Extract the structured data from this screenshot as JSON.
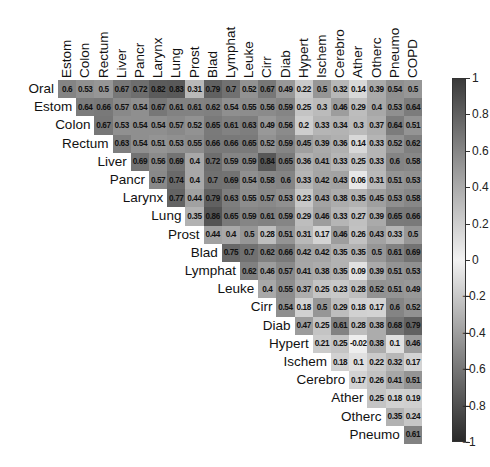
{
  "chart_data": {
    "type": "heatmap",
    "title": "",
    "subtitle": "",
    "variables": [
      "Oral",
      "Estom",
      "Colon",
      "Rectum",
      "Liver",
      "Pancr",
      "Larynx",
      "Lung",
      "Prost",
      "Blad",
      "Lymphat",
      "Leuke",
      "Cirr",
      "Diab",
      "Hypert",
      "Ischem",
      "Cerebro",
      "Ather",
      "Otherc",
      "Pneumo",
      "COPD"
    ],
    "row_labels": [
      "Oral",
      "Estom",
      "Colon",
      "Rectum",
      "Liver",
      "Pancr",
      "Larynx",
      "Lung",
      "Prost",
      "Blad",
      "Lymphat",
      "Leuke",
      "Cirr",
      "Diab",
      "Hypert",
      "Ischem",
      "Cerebro",
      "Ather",
      "Otherc",
      "Pneumo"
    ],
    "col_labels": [
      "Estom",
      "Colon",
      "Rectum",
      "Liver",
      "Pancr",
      "Larynx",
      "Lung",
      "Prost",
      "Blad",
      "Lymphat",
      "Leuke",
      "Cirr",
      "Diab",
      "Hypert",
      "Ischem",
      "Cerebro",
      "Ather",
      "Otherc",
      "Pneumo",
      "COPD"
    ],
    "layout": "upper-triangular; row i shows correlations with columns i..19",
    "values": [
      [
        "0.6",
        "0.53",
        "0.5",
        "0.67",
        "0.72",
        "0.82",
        "0.83",
        "0.31",
        "0.79",
        "0.7",
        "0.52",
        "0.67",
        "0.49",
        "0.22",
        "0.5",
        "0.32",
        "0.14",
        "0.39",
        "0.54",
        "0.5"
      ],
      [
        "0.64",
        "0.66",
        "0.57",
        "0.54",
        "0.67",
        "0.61",
        "0.61",
        "0.62",
        "0.54",
        "0.55",
        "0.56",
        "0.59",
        "0.25",
        "0.3",
        "0.46",
        "0.29",
        "0.4",
        "0.53",
        "0.64"
      ],
      [
        "0.67",
        "0.53",
        "0.54",
        "0.54",
        "0.57",
        "0.52",
        "0.65",
        "0.61",
        "0.63",
        "0.49",
        "0.56",
        "0.2",
        "0.33",
        "0.34",
        "0.3",
        "0.37",
        "0.64",
        "0.51"
      ],
      [
        "0.63",
        "0.54",
        "0.51",
        "0.53",
        "0.55",
        "0.66",
        "0.66",
        "0.65",
        "0.52",
        "0.59",
        "0.45",
        "0.39",
        "0.36",
        "0.14",
        "0.33",
        "0.52",
        "0.62"
      ],
      [
        "0.69",
        "0.56",
        "0.69",
        "0.4",
        "0.72",
        "0.59",
        "0.59",
        "0.84",
        "0.65",
        "0.36",
        "0.41",
        "0.33",
        "0.25",
        "0.33",
        "0.6",
        "0.58"
      ],
      [
        "0.57",
        "0.74",
        "0.4",
        "0.7",
        "0.69",
        "0.54",
        "0.58",
        "0.6",
        "0.33",
        "0.42",
        "0.43",
        "0.06",
        "0.31",
        "0.51",
        "0.53"
      ],
      [
        "0.77",
        "0.44",
        "0.79",
        "0.63",
        "0.55",
        "0.57",
        "0.53",
        "0.23",
        "0.43",
        "0.38",
        "0.35",
        "0.45",
        "0.53",
        "0.58"
      ],
      [
        "0.35",
        "0.86",
        "0.65",
        "0.59",
        "0.61",
        "0.59",
        "0.29",
        "0.46",
        "0.33",
        "0.27",
        "0.39",
        "0.65",
        "0.66"
      ],
      [
        "0.44",
        "0.4",
        "0.5",
        "0.28",
        "0.51",
        "0.31",
        "0.17",
        "0.46",
        "0.26",
        "0.43",
        "0.33",
        "0.5"
      ],
      [
        "0.75",
        "0.7",
        "0.62",
        "0.66",
        "0.42",
        "0.42",
        "0.35",
        "0.35",
        "0.5",
        "0.61",
        "0.69"
      ],
      [
        "0.62",
        "0.46",
        "0.57",
        "0.41",
        "0.38",
        "0.35",
        "0.09",
        "0.39",
        "0.51",
        "0.53"
      ],
      [
        "0.4",
        "0.55",
        "0.37",
        "0.25",
        "0.23",
        "0.28",
        "0.52",
        "0.51",
        "0.49"
      ],
      [
        "0.54",
        "0.18",
        "0.5",
        "0.29",
        "0.18",
        "0.17",
        "0.6",
        "0.52"
      ],
      [
        "0.47",
        "0.25",
        "0.61",
        "0.28",
        "0.38",
        "0.68",
        "0.79"
      ],
      [
        "0.21",
        "0.25",
        "-0.02",
        "0.38",
        "0.1",
        "0.46"
      ],
      [
        "0.18",
        "0.1",
        "0.22",
        "0.32",
        "0.17"
      ],
      [
        "0.17",
        "0.26",
        "0.41",
        "0.51"
      ],
      [
        "0.25",
        "0.18",
        "0.19"
      ],
      [
        "0.35",
        "0.24"
      ],
      [
        "0.61"
      ]
    ],
    "colorbar": {
      "range": [
        -1,
        1
      ],
      "ticks": [
        "1",
        "0.8",
        "0.6",
        "0.4",
        "0.2",
        "0",
        "−0.2",
        "−0.4",
        "−0.6",
        "−0.8",
        "−1"
      ],
      "colors": {
        "high": "#3a3a3a",
        "mid": "#f2f2f2",
        "low": "#2a2a2a"
      },
      "position": "right"
    },
    "grid": false,
    "legend": "colorbar"
  }
}
